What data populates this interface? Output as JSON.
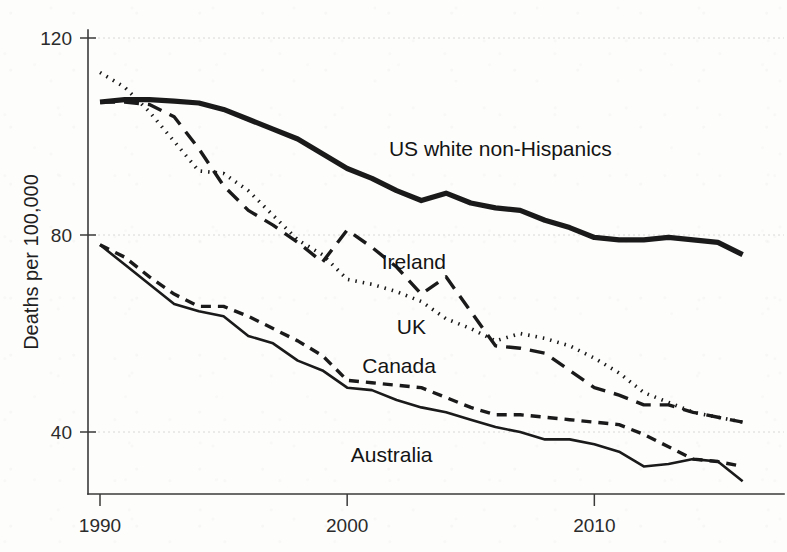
{
  "chart_data": {
    "type": "line",
    "title": "",
    "subtitle": "",
    "xlabel": "",
    "ylabel": "Deaths per 100,000",
    "xlim": [
      1990,
      2016.5
    ],
    "ylim": [
      25,
      124
    ],
    "xticks": [
      1990,
      2000,
      2010
    ],
    "xtick_labels": [
      "1990",
      "2000",
      "2010"
    ],
    "yticks": [
      40,
      80,
      120
    ],
    "ytick_labels": [
      "40",
      "80",
      "120"
    ],
    "grid": "horizontal-dotted-faint",
    "legend_position": "inline-annotations",
    "x": [
      1990,
      1991,
      1992,
      1993,
      1994,
      1995,
      1996,
      1997,
      1998,
      1999,
      2000,
      2001,
      2002,
      2003,
      2004,
      2005,
      2006,
      2007,
      2008,
      2009,
      2010,
      2011,
      2012,
      2013,
      2014,
      2015,
      2016
    ],
    "series": [
      {
        "name": "US white non-Hispanics",
        "label": "US white non-Hispanics",
        "line_style": "solid-thick",
        "color": "#1a1a1a",
        "stroke_width": 5.2,
        "label_x": 2006.2,
        "label_y": 96,
        "values": [
          107,
          107.5,
          107.5,
          107.2,
          106.8,
          105.5,
          103.5,
          101.5,
          99.5,
          96.5,
          93.5,
          91.5,
          89,
          87,
          88.5,
          86.5,
          85.5,
          85,
          83,
          81.5,
          79.5,
          79,
          79,
          79.5,
          79,
          78.5,
          76
        ]
      },
      {
        "name": "Ireland",
        "label": "Ireland",
        "line_style": "long-dash",
        "color": "#1a1a1a",
        "stroke_width": 3.4,
        "dasharray": "15 9",
        "label_x": 2002.7,
        "label_y": 73,
        "values": [
          107,
          107,
          106.5,
          104,
          97.5,
          90,
          85,
          82,
          78.5,
          74.5,
          81,
          77.5,
          73.5,
          68,
          71.5,
          64.5,
          57.5,
          57,
          56,
          52.5,
          49,
          47.5,
          45.5,
          45.5,
          44,
          43,
          42
        ]
      },
      {
        "name": "UK",
        "label": "UK",
        "line_style": "dotted",
        "color": "#1a1a1a",
        "stroke_width": 3.6,
        "dasharray": "1.5 6",
        "label_x": 2002.6,
        "label_y": 60,
        "values": [
          113,
          110,
          105,
          99,
          93,
          92.5,
          89,
          84,
          79,
          76,
          71,
          70,
          68.5,
          66.5,
          63,
          61,
          58.5,
          60,
          59,
          57.5,
          55,
          52,
          48,
          46,
          44,
          43,
          42
        ]
      },
      {
        "name": "Canada",
        "label": "Canada",
        "line_style": "medium-dash",
        "color": "#1a1a1a",
        "stroke_width": 3.4,
        "dasharray": "10 7",
        "label_x": 2002.1,
        "label_y": 52,
        "values": [
          78,
          75.5,
          71.5,
          68,
          65.5,
          65.5,
          63.5,
          61,
          58.5,
          55.5,
          50.5,
          50,
          49.5,
          49,
          47,
          45,
          43.5,
          43.5,
          43,
          42.5,
          42,
          41.5,
          39.5,
          37,
          34.5,
          34,
          33
        ]
      },
      {
        "name": "Australia",
        "label": "Australia",
        "line_style": "solid-thin",
        "color": "#1a1a1a",
        "stroke_width": 2.6,
        "label_x": 2001.8,
        "label_y": 34,
        "values": [
          78,
          74,
          70,
          66,
          64.5,
          63.5,
          59.5,
          58,
          54.5,
          52.5,
          49,
          48.5,
          46.5,
          45,
          44,
          42.5,
          41,
          40,
          38.5,
          38.5,
          37.5,
          36,
          33,
          33.5,
          34.5,
          34,
          30
        ]
      }
    ]
  },
  "axis": {
    "y_title": "Deaths per 100,000"
  }
}
